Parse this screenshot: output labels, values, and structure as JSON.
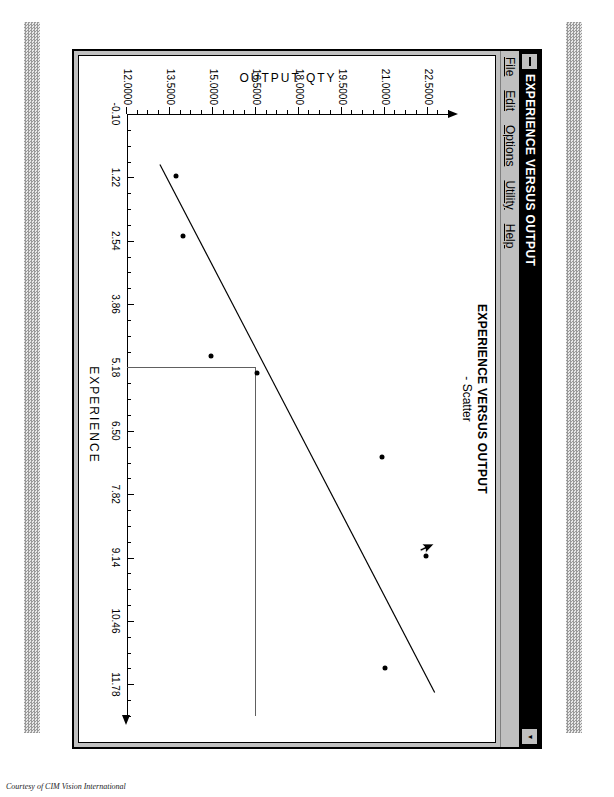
{
  "window": {
    "title": "EXPERIENCE VERSUS OUTPUT",
    "system_menu_icon": "system-menu-icon",
    "minimize_label": "▾",
    "maximize_label": "▴"
  },
  "menu": {
    "items": [
      {
        "label": "File",
        "mnemonic": "F"
      },
      {
        "label": "Edit",
        "mnemonic": "E"
      },
      {
        "label": "Options",
        "mnemonic": "O"
      },
      {
        "label": "Utility",
        "mnemonic": "U"
      },
      {
        "label": "Help",
        "mnemonic": "H"
      }
    ]
  },
  "chart_title": {
    "line1": "EXPERIENCE VERSUS OUTPUT",
    "line2": "-  Scatter"
  },
  "credit": "Courtesy of CIM Vision International",
  "colors": {
    "window_face": "#c0c0c0",
    "titlebar": "#000000",
    "titlebar_text": "#ffffff",
    "plot_background": "#ffffff",
    "ink": "#000000",
    "crosshair": "#606060"
  },
  "chart_data": {
    "type": "scatter",
    "title": "EXPERIENCE VERSUS OUTPUT - Scatter",
    "xlabel": "EXPERIENCE",
    "ylabel": "OUTPUT QTY",
    "xlim": [
      -0.1,
      12.44
    ],
    "ylim": [
      12.0,
      23.25
    ],
    "xticks": [
      -0.1,
      1.22,
      2.54,
      3.86,
      5.18,
      6.5,
      7.82,
      9.14,
      10.46,
      11.78
    ],
    "xtick_labels": [
      "-0.10",
      "1.22",
      "2.54",
      "3.86",
      "5.18",
      "6.50",
      "7.82",
      "9.14",
      "10.46",
      "11.78"
    ],
    "yticks": [
      12.0,
      13.5,
      15.0,
      16.5,
      18.0,
      19.5,
      21.0,
      22.5
    ],
    "ytick_labels": [
      "12.0000",
      "13.5000",
      "15.0000",
      "16.5000",
      "18.0000",
      "19.5000",
      "21.0000",
      "22.5000"
    ],
    "grid": false,
    "legend": false,
    "minor_ticks_per_major": 4,
    "series": [
      {
        "name": "Scatter",
        "marker": "filled-circle",
        "points": [
          {
            "x": 1.2,
            "y": 13.7
          },
          {
            "x": 2.45,
            "y": 13.95
          },
          {
            "x": 4.95,
            "y": 14.95
          },
          {
            "x": 5.3,
            "y": 16.55
          },
          {
            "x": 7.05,
            "y": 20.9
          },
          {
            "x": 9.1,
            "y": 22.45
          },
          {
            "x": 11.45,
            "y": 21.0
          }
        ]
      }
    ],
    "fit_line": {
      "name": "regression-line",
      "x_start": 0.95,
      "y_start": 13.15,
      "x_end": 11.95,
      "y_end": 22.75
    },
    "crosshair": {
      "x": 5.18,
      "y": 16.5
    }
  }
}
